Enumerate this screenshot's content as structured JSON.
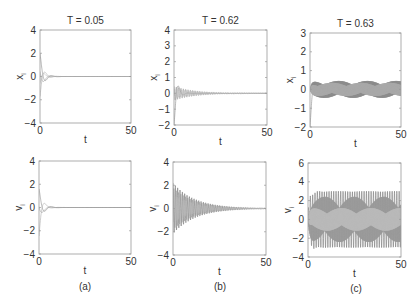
{
  "figure": {
    "captions": [
      "(a)",
      "(b)",
      "(c)"
    ]
  },
  "chart_data": [
    {
      "type": "line",
      "panel": "a-top",
      "title": "T = 0.05",
      "xlabel": "t",
      "ylabel": "x_i",
      "xlim": [
        0,
        50
      ],
      "ylim": [
        -4,
        4
      ],
      "xticks": [
        0,
        50
      ],
      "yticks": [
        -4,
        -2,
        0,
        2,
        4
      ],
      "grid": false,
      "box": {
        "x": 40,
        "y": 30,
        "w": 91,
        "h": 93
      },
      "behavior": "fast decay to 0 by t~10",
      "curves": [
        {
          "amp": 2.0,
          "decay": 0.55,
          "freq": 0.9,
          "phase": 0.0,
          "sustain": 0,
          "color": "#888"
        },
        {
          "amp": -1.8,
          "decay": 0.55,
          "freq": 0.9,
          "phase": 0.3,
          "sustain": 0,
          "color": "#aaa"
        },
        {
          "amp": 1.2,
          "decay": 0.5,
          "freq": 0.8,
          "phase": 1.2,
          "sustain": 0,
          "color": "#999"
        },
        {
          "amp": -0.8,
          "decay": 0.5,
          "freq": 1.0,
          "phase": 0.7,
          "sustain": 0,
          "color": "#bbb"
        }
      ]
    },
    {
      "type": "line",
      "panel": "b-top",
      "title": "T = 0.62",
      "xlabel": "t",
      "ylabel": "x_i",
      "xlim": [
        0,
        50
      ],
      "ylim": [
        -2,
        4
      ],
      "xticks": [
        0,
        50
      ],
      "yticks": [
        -2,
        -1,
        0,
        1,
        2,
        3,
        4
      ],
      "grid": false,
      "box": {
        "x": 174,
        "y": 30,
        "w": 93,
        "h": 95
      },
      "behavior": "slowly decaying oscillation converging to 0",
      "curves": [
        {
          "amp": -2.0,
          "decay": 0.6,
          "freq": 1.2,
          "phase": 0.0,
          "sustain": 0,
          "color": "#888"
        },
        {
          "amp": 0.45,
          "decay": 0.09,
          "freq": 5.0,
          "phase": 0.0,
          "sustain": 0,
          "color": "#999"
        },
        {
          "amp": -0.3,
          "decay": 0.08,
          "freq": 5.0,
          "phase": 1.0,
          "sustain": 0,
          "color": "#bbb"
        }
      ]
    },
    {
      "type": "line",
      "panel": "c-top",
      "title": "T = 0.63",
      "xlabel": "t",
      "ylabel": "x_i",
      "xlim": [
        0,
        50
      ],
      "ylim": [
        -2,
        3
      ],
      "xticks": [
        0,
        50
      ],
      "yticks": [
        -2,
        -1,
        0,
        1,
        2,
        3
      ],
      "grid": false,
      "box": {
        "x": 310,
        "y": 33,
        "w": 91,
        "h": 94
      },
      "behavior": "sustained oscillation between ~-0.5 and 0.5",
      "curves": [
        {
          "amp": -2.0,
          "decay": 0.7,
          "freq": 1.0,
          "phase": 0.0,
          "sustain": 0,
          "color": "#888"
        },
        {
          "amp": 0.0,
          "decay": 0.0,
          "freq": 5.0,
          "phase": 0.0,
          "sustain": 0.45,
          "color": "#888"
        },
        {
          "amp": 0.0,
          "decay": 0.0,
          "freq": 5.0,
          "phase": 1.6,
          "sustain": 0.35,
          "color": "#aaa"
        }
      ]
    },
    {
      "type": "line",
      "panel": "a-bottom",
      "title": "",
      "xlabel": "t",
      "ylabel": "v_i",
      "xlim": [
        0,
        50
      ],
      "ylim": [
        -4,
        4
      ],
      "xticks": [
        0,
        50
      ],
      "yticks": [
        -4,
        -2,
        0,
        2,
        4
      ],
      "grid": false,
      "box": {
        "x": 39,
        "y": 161,
        "w": 92,
        "h": 93
      },
      "behavior": "fast decay to 0 by t~10",
      "curves": [
        {
          "amp": 1.6,
          "decay": 0.5,
          "freq": 0.9,
          "phase": 0.0,
          "sustain": 0,
          "color": "#888"
        },
        {
          "amp": -2.5,
          "decay": 0.6,
          "freq": 0.8,
          "phase": 0.2,
          "sustain": 0,
          "color": "#aaa"
        },
        {
          "amp": 1.0,
          "decay": 0.45,
          "freq": 0.7,
          "phase": 1.5,
          "sustain": 0,
          "color": "#999"
        }
      ]
    },
    {
      "type": "line",
      "panel": "b-bottom",
      "title": "",
      "xlabel": "t",
      "ylabel": "v_i",
      "xlim": [
        0,
        50
      ],
      "ylim": [
        -4,
        4
      ],
      "xticks": [
        0,
        50
      ],
      "yticks": [
        -4,
        -2,
        0,
        2,
        4
      ],
      "grid": false,
      "box": {
        "x": 173,
        "y": 162,
        "w": 93,
        "h": 93
      },
      "behavior": "oscillation amplitude ~2 decaying to 0 by t~50",
      "curves": [
        {
          "amp": 2.2,
          "decay": 0.085,
          "freq": 5.0,
          "phase": 0.0,
          "sustain": 0,
          "color": "#777"
        },
        {
          "amp": -1.8,
          "decay": 0.085,
          "freq": 5.0,
          "phase": 0.9,
          "sustain": 0,
          "color": "#999"
        },
        {
          "amp": 1.2,
          "decay": 0.09,
          "freq": 5.0,
          "phase": 2.1,
          "sustain": 0,
          "color": "#bbb"
        }
      ]
    },
    {
      "type": "line",
      "panel": "c-bottom",
      "title": "",
      "xlabel": "t",
      "ylabel": "v_i",
      "xlim": [
        0,
        50
      ],
      "ylim": [
        -4,
        6
      ],
      "xticks": [
        0,
        50
      ],
      "yticks": [
        -4,
        -2,
        0,
        2,
        4,
        6
      ],
      "grid": false,
      "box": {
        "x": 308,
        "y": 163,
        "w": 93,
        "h": 94
      },
      "behavior": "sustained oscillation between ~-3 and 3",
      "curves": [
        {
          "amp": 1.0,
          "decay": 0.5,
          "freq": 1.0,
          "phase": 0.0,
          "sustain": 3.0,
          "color": "#777"
        },
        {
          "amp": 0.0,
          "decay": 0.0,
          "freq": 5.0,
          "phase": 1.2,
          "sustain": 2.4,
          "color": "#999"
        },
        {
          "amp": 0.0,
          "decay": 0.0,
          "freq": 5.0,
          "phase": 2.4,
          "sustain": 1.2,
          "color": "#bbb"
        }
      ]
    }
  ]
}
